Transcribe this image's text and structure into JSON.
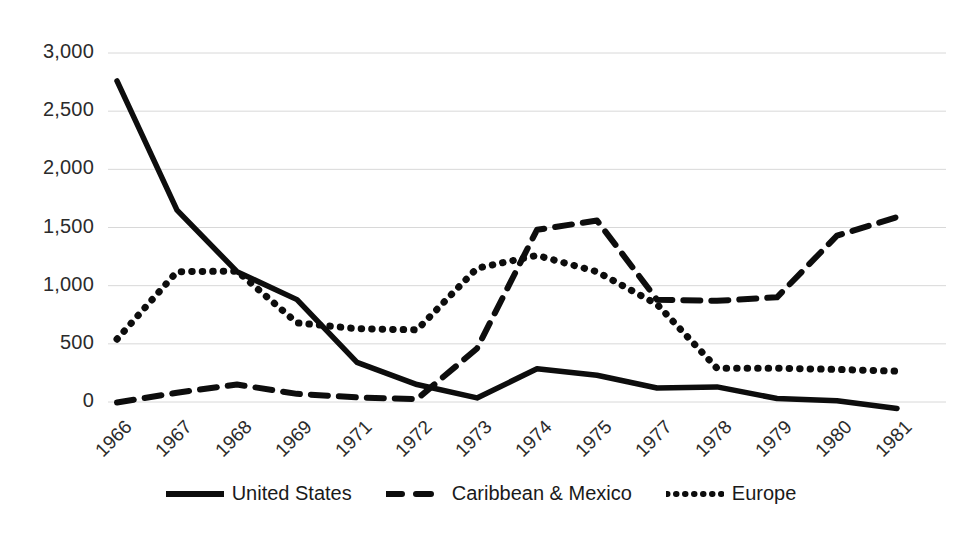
{
  "chart_data": {
    "type": "line",
    "title": "",
    "xlabel": "",
    "ylabel": "",
    "ylim": [
      -250,
      3000
    ],
    "ytick_values": [
      0,
      500,
      1000,
      1500,
      2000,
      2500,
      3000
    ],
    "ytick_labels": [
      "0",
      "500",
      "1,000",
      "1,500",
      "2,000",
      "2,500",
      "3,000"
    ],
    "grid": true,
    "legend_position": "bottom",
    "categories": [
      "1966",
      "1967",
      "1968",
      "1969",
      "1971",
      "1972",
      "1973",
      "1974",
      "1975",
      "1977",
      "1978",
      "1979",
      "1980",
      "1981"
    ],
    "series": [
      {
        "name": "United States",
        "style": "solid",
        "color": "#0d0d0d",
        "values": [
          2760,
          1650,
          1120,
          880,
          340,
          150,
          35,
          285,
          230,
          120,
          130,
          30,
          10,
          -55
        ]
      },
      {
        "name": "Caribbean & Mexico",
        "style": "dashed",
        "color": "#0d0d0d",
        "values": [
          -5,
          80,
          150,
          70,
          40,
          25,
          460,
          1480,
          1560,
          880,
          870,
          900,
          1430,
          1590
        ]
      },
      {
        "name": "Europe",
        "style": "dotted",
        "color": "#0d0d0d",
        "values": [
          540,
          1120,
          1125,
          680,
          630,
          620,
          1150,
          1260,
          1120,
          840,
          290,
          290,
          280,
          265
        ]
      }
    ]
  },
  "legend": {
    "items": [
      {
        "label": "United States",
        "key": "solid-line-key"
      },
      {
        "label": "Caribbean & Mexico",
        "key": "dashed-line-key"
      },
      {
        "label": "Europe",
        "key": "dotted-line-key"
      }
    ]
  },
  "colors": {
    "series": "#0d0d0d",
    "grid": "#d8d8d8",
    "text": "#2b2b2b",
    "background": "#ffffff"
  }
}
